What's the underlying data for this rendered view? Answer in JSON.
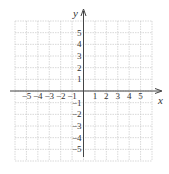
{
  "chart_data": {
    "type": "scatter",
    "title": "",
    "xlabel": "x",
    "ylabel": "y",
    "xlim": [
      -6,
      6
    ],
    "ylim": [
      -6,
      6
    ],
    "grid": true,
    "x_ticks": [
      -5,
      -4,
      -3,
      -2,
      -1,
      1,
      2,
      3,
      4,
      5
    ],
    "y_ticks": [
      5,
      4,
      3,
      2,
      1,
      -1,
      -2,
      -3,
      -4,
      -5
    ],
    "x_tick_labels": [
      "−5",
      "−4",
      "−3",
      "−2",
      "−1",
      "1",
      "2",
      "3",
      "4",
      "5"
    ],
    "y_tick_labels": [
      "5",
      "4",
      "3",
      "2",
      "1",
      "−1",
      "−2",
      "−3",
      "−4",
      "−5"
    ],
    "series": []
  },
  "colors": {
    "grid": "#c8c8c8",
    "axis": "#444444",
    "text": "#333333"
  }
}
